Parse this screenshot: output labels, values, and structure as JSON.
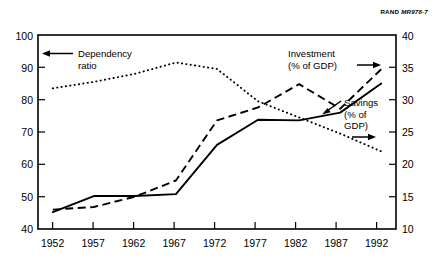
{
  "credit": {
    "org": "RAND",
    "code": "MR978-7"
  },
  "chart_data": {
    "type": "line",
    "title": "",
    "xlabel": "",
    "ylabel": "",
    "grid": false,
    "legend_position": "inline-annotations",
    "x": [
      1952,
      1957,
      1962,
      1967,
      1972,
      1977,
      1982,
      1987,
      1992
    ],
    "xtick_labels": [
      "1952",
      "1957",
      "1962",
      "1967",
      "1972",
      "1977",
      "1982",
      "1987",
      "1992"
    ],
    "xlim": [
      1950.2,
      1993.8
    ],
    "axes": [
      {
        "id": "left",
        "side": "left",
        "ylim": [
          40,
          100
        ],
        "ytick_labels": [
          "40",
          "50",
          "60",
          "70",
          "80",
          "90",
          "100"
        ],
        "yticks": [
          40,
          50,
          60,
          70,
          80,
          90,
          100
        ]
      },
      {
        "id": "right",
        "side": "right",
        "ylim": [
          10,
          40
        ],
        "ytick_labels": [
          "10",
          "15",
          "20",
          "25",
          "30",
          "35",
          "40"
        ],
        "yticks": [
          10,
          15,
          20,
          25,
          30,
          35,
          40
        ]
      }
    ],
    "series": [
      {
        "name": "Dependency ratio",
        "axis": "left",
        "style": "dotted",
        "values": [
          83.5,
          85.5,
          88.0,
          91.5,
          89.5,
          79.5,
          74.5,
          69.5,
          64.0
        ]
      },
      {
        "name": "Investment (% of GDP)",
        "axis": "right",
        "style": "dashed",
        "values": [
          13.0,
          13.4,
          15.0,
          17.5,
          26.8,
          28.8,
          32.4,
          28.6,
          34.7
        ]
      },
      {
        "name": "Savings (% of GDP)",
        "axis": "right",
        "style": "solid",
        "values": [
          12.6,
          15.1,
          15.1,
          15.4,
          23.0,
          26.9,
          26.8,
          28.0,
          32.5
        ]
      }
    ],
    "annotations": [
      {
        "id": "dependency",
        "text_lines": [
          "Dependency",
          "ratio"
        ],
        "arrow": "left"
      },
      {
        "id": "investment",
        "text_lines": [
          "Investment",
          "(% of GDP)"
        ],
        "arrow": "right"
      },
      {
        "id": "savings",
        "text_lines": [
          "Savings",
          "(% of",
          "GDP)"
        ],
        "arrow": "right"
      }
    ]
  }
}
